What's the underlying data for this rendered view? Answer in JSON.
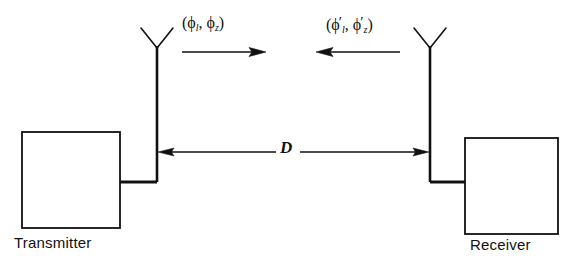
{
  "figure": {
    "type": "radio-link-block-diagram",
    "background_color": "#ffffff",
    "line_color": "#111111"
  },
  "blocks": {
    "transmitter": {
      "label": "Transmitter",
      "x": 22,
      "y": 132,
      "width": 98,
      "height": 96
    },
    "receiver": {
      "label": "Receiver",
      "x": 465,
      "y": 138,
      "width": 93,
      "height": 96
    }
  },
  "antennas": {
    "transmitter_antenna": {
      "name": "dipole-antenna",
      "mast_x": 157,
      "top_y": 28,
      "bottom_y": 182
    },
    "receiver_antenna": {
      "name": "dipole-antenna",
      "mast_x": 430,
      "top_y": 28,
      "bottom_y": 182
    }
  },
  "propagation": {
    "forward": {
      "label_parts": {
        "open": "(",
        "phi1": "ϕ",
        "sub1": "l",
        "comma": ", ",
        "phi2": "ϕ",
        "sub2": "z",
        "close": ")"
      },
      "label_text": "(ϕl, ϕz)",
      "direction": "right",
      "arrow_x1": 182,
      "arrow_x2": 266,
      "arrow_y": 52
    },
    "reverse": {
      "label_parts": {
        "open": "(",
        "phi1": "ϕ",
        "sub1": "l",
        "prime1": "′",
        "comma": ", ",
        "phi2": "ϕ",
        "sub2": "z",
        "prime2": "′",
        "close": ")"
      },
      "label_text": "(ϕ′l, ϕ′z)",
      "direction": "left",
      "arrow_x1": 400,
      "arrow_x2": 316,
      "arrow_y": 52
    }
  },
  "distance": {
    "symbol": "D",
    "arrow_y": 152,
    "arrow_left_x": 158,
    "arrow_right_x": 429
  }
}
